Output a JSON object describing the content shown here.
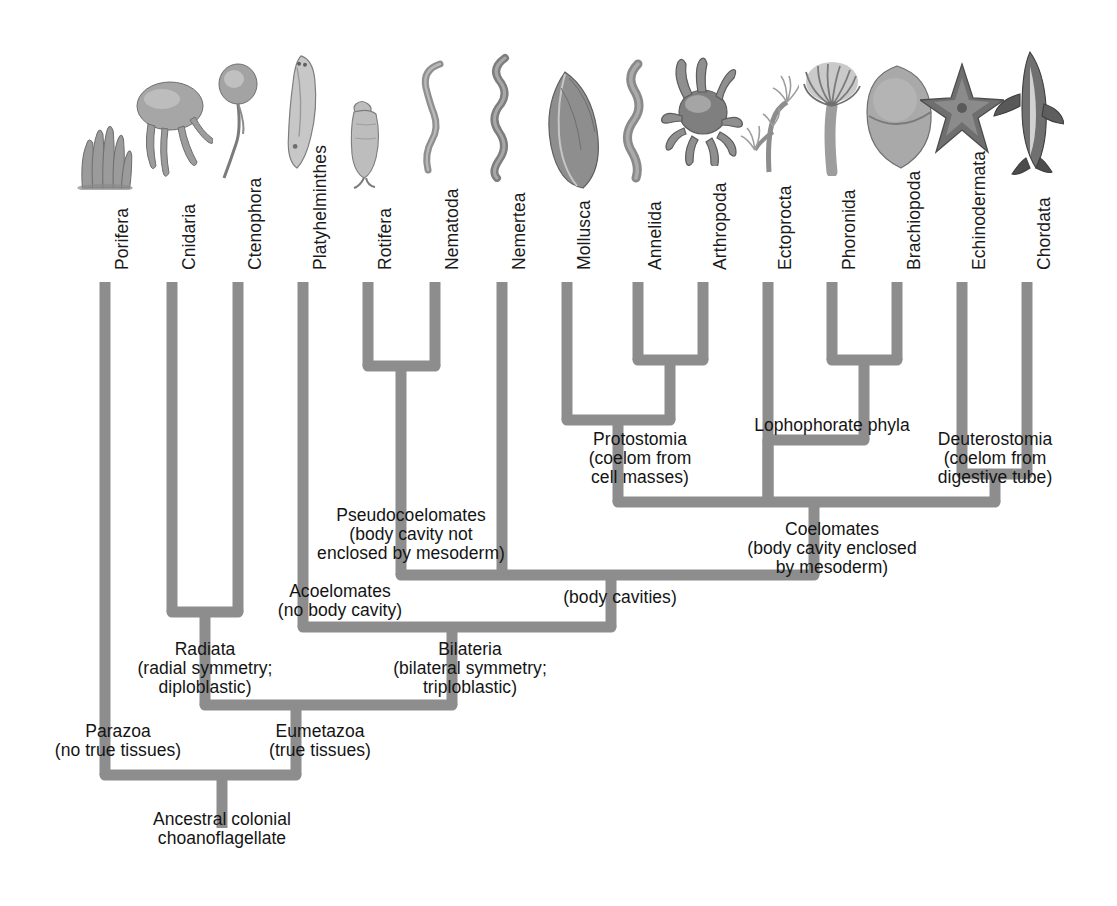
{
  "figure": {
    "type": "cladogram",
    "branch_color": "#8d8d8d",
    "background_color": "#ffffff",
    "text_color": "#141414"
  },
  "taxa": [
    {
      "name": "Porifera",
      "x": 105,
      "organism": "sponge-illustration",
      "organism_w": 62,
      "organism_h": 72,
      "organism_y": 118
    },
    {
      "name": "Cnidaria",
      "x": 172,
      "organism": "jellyfish-illustration",
      "organism_w": 82,
      "organism_h": 110,
      "organism_y": 72
    },
    {
      "name": "Ctenophora",
      "x": 238,
      "organism": "comb-jelly-illustration",
      "organism_w": 52,
      "organism_h": 120,
      "organism_y": 62
    },
    {
      "name": "Platyhelminthes",
      "x": 303,
      "organism": "flatworm-illustration",
      "organism_w": 50,
      "organism_h": 120,
      "organism_y": 52
    },
    {
      "name": "Rotifera",
      "x": 368,
      "organism": "rotifer-illustration",
      "organism_w": 40,
      "organism_h": 92,
      "organism_y": 98
    },
    {
      "name": "Nematoda",
      "x": 435,
      "organism": "roundworm-illustration",
      "organism_w": 52,
      "organism_h": 122,
      "organism_y": 58
    },
    {
      "name": "Nemertea",
      "x": 502,
      "organism": "ribbon-worm-illustration",
      "organism_w": 46,
      "organism_h": 130,
      "organism_y": 52
    },
    {
      "name": "Mollusca",
      "x": 567,
      "organism": "mussel-illustration",
      "organism_w": 72,
      "organism_h": 122,
      "organism_y": 68
    },
    {
      "name": "Annelida",
      "x": 638,
      "organism": "earthworm-illustration",
      "organism_w": 46,
      "organism_h": 126,
      "organism_y": 58
    },
    {
      "name": "Arthropoda",
      "x": 703,
      "organism": "crab-illustration",
      "organism_w": 86,
      "organism_h": 112,
      "organism_y": 54
    },
    {
      "name": "Ectoprocta",
      "x": 768,
      "organism": "bryozoan-illustration",
      "organism_w": 62,
      "organism_h": 118,
      "organism_y": 60
    },
    {
      "name": "Phoronida",
      "x": 832,
      "organism": "phoronid-illustration",
      "organism_w": 62,
      "organism_h": 124,
      "organism_y": 52
    },
    {
      "name": "Brachiopoda",
      "x": 897,
      "organism": "lampshell-illustration",
      "organism_w": 76,
      "organism_h": 112,
      "organism_y": 60
    },
    {
      "name": "Echinodermata",
      "x": 962,
      "organism": "sea-star-illustration",
      "organism_w": 84,
      "organism_h": 96,
      "organism_y": 60
    },
    {
      "name": "Chordata",
      "x": 1027,
      "organism": "shark-illustration",
      "organism_w": 74,
      "organism_h": 128,
      "organism_y": 48
    }
  ],
  "tip_label_baseline_y": 270,
  "branch_top_y": 282,
  "node_labels": [
    {
      "id": "pseudocoelomates",
      "align": "center",
      "x": 411,
      "y": 506,
      "lines": [
        "Pseudocoelomates",
        "(body cavity not",
        "enclosed by mesoderm)"
      ]
    },
    {
      "id": "acoelomates",
      "align": "center",
      "x": 340,
      "y": 582,
      "lines": [
        "Acoelomates",
        "(no body cavity)"
      ]
    },
    {
      "id": "protostomia",
      "align": "center",
      "x": 640,
      "y": 430,
      "lines": [
        "Protostomia",
        "(coelom from",
        "cell masses)"
      ]
    },
    {
      "id": "lophophorate-phyla",
      "align": "center",
      "x": 832,
      "y": 416,
      "lines": [
        "Lophophorate phyla"
      ]
    },
    {
      "id": "deuterostomia",
      "align": "center",
      "x": 995,
      "y": 430,
      "lines": [
        "Deuterostomia",
        "(coelom from",
        "digestive tube)"
      ]
    },
    {
      "id": "coelomates",
      "align": "center",
      "x": 832,
      "y": 520,
      "lines": [
        "Coelomates",
        "(body cavity enclosed",
        "by mesoderm)"
      ]
    },
    {
      "id": "body-cavities",
      "align": "center",
      "x": 620,
      "y": 588,
      "lines": [
        "(body cavities)"
      ]
    },
    {
      "id": "radiata",
      "align": "center",
      "x": 205,
      "y": 640,
      "lines": [
        "Radiata",
        "(radial symmetry;",
        "diploblastic)"
      ]
    },
    {
      "id": "bilateria",
      "align": "center",
      "x": 470,
      "y": 640,
      "lines": [
        "Bilateria",
        "(bilateral symmetry;",
        "triploblastic)"
      ]
    },
    {
      "id": "parazoa",
      "align": "center",
      "x": 118,
      "y": 722,
      "lines": [
        "Parazoa",
        "(no true tissues)"
      ]
    },
    {
      "id": "eumetazoa",
      "align": "center",
      "x": 320,
      "y": 722,
      "lines": [
        "Eumetazoa",
        "(true tissues)"
      ]
    },
    {
      "id": "ancestral-root",
      "align": "center",
      "x": 222,
      "y": 810,
      "lines": [
        "Ancestral colonial",
        "choanoflagellate"
      ]
    }
  ],
  "chart_data": {
    "type": "tree",
    "root": "Ancestral colonial choanoflagellate",
    "tips": [
      "Porifera",
      "Cnidaria",
      "Ctenophora",
      "Platyhelminthes",
      "Rotifera",
      "Nematoda",
      "Nemertea",
      "Mollusca",
      "Annelida",
      "Arthropoda",
      "Ectoprocta",
      "Phoronida",
      "Brachiopoda",
      "Echinodermata",
      "Chordata"
    ],
    "clades": [
      {
        "name": "Parazoa",
        "note": "no true tissues",
        "members": [
          "Porifera"
        ]
      },
      {
        "name": "Eumetazoa",
        "note": "true tissues",
        "members": [
          "Cnidaria",
          "Ctenophora",
          "Platyhelminthes",
          "Rotifera",
          "Nematoda",
          "Nemertea",
          "Mollusca",
          "Annelida",
          "Arthropoda",
          "Ectoprocta",
          "Phoronida",
          "Brachiopoda",
          "Echinodermata",
          "Chordata"
        ]
      },
      {
        "name": "Radiata",
        "note": "radial symmetry; diploblastic",
        "members": [
          "Cnidaria",
          "Ctenophora"
        ]
      },
      {
        "name": "Bilateria",
        "note": "bilateral symmetry; triploblastic",
        "members": [
          "Platyhelminthes",
          "Rotifera",
          "Nematoda",
          "Nemertea",
          "Mollusca",
          "Annelida",
          "Arthropoda",
          "Ectoprocta",
          "Phoronida",
          "Brachiopoda",
          "Echinodermata",
          "Chordata"
        ]
      },
      {
        "name": "Acoelomates",
        "note": "no body cavity",
        "members": [
          "Platyhelminthes"
        ]
      },
      {
        "name": "(body cavities)",
        "note": "",
        "members": [
          "Rotifera",
          "Nematoda",
          "Nemertea",
          "Mollusca",
          "Annelida",
          "Arthropoda",
          "Ectoprocta",
          "Phoronida",
          "Brachiopoda",
          "Echinodermata",
          "Chordata"
        ]
      },
      {
        "name": "Pseudocoelomates",
        "note": "body cavity not enclosed by mesoderm",
        "members": [
          "Rotifera",
          "Nematoda"
        ]
      },
      {
        "name": "Coelomates",
        "note": "body cavity enclosed by mesoderm",
        "members": [
          "Nemertea",
          "Mollusca",
          "Annelida",
          "Arthropoda",
          "Ectoprocta",
          "Phoronida",
          "Brachiopoda",
          "Echinodermata",
          "Chordata"
        ]
      },
      {
        "name": "Protostomia",
        "note": "coelom from cell masses",
        "members": [
          "Mollusca",
          "Annelida",
          "Arthropoda"
        ]
      },
      {
        "name": "Lophophorate phyla",
        "note": "",
        "members": [
          "Ectoprocta",
          "Phoronida",
          "Brachiopoda"
        ]
      },
      {
        "name": "Deuterostomia",
        "note": "coelom from digestive tube",
        "members": [
          "Echinodermata",
          "Chordata"
        ]
      }
    ]
  },
  "geometry": {
    "stroke_width": 11,
    "nodes": {
      "rotifera_nematoda": {
        "y": 366
      },
      "annelida_arthropoda": {
        "y": 360
      },
      "phoronida_brachiopoda": {
        "y": 360
      },
      "echinodermata_chordata": {
        "y": 474
      },
      "protostomia": {
        "y": 420,
        "x": 596
      },
      "lophophorate": {
        "y": 416,
        "x": 864
      },
      "pseudocoelomates": {
        "y": 400,
        "x": 401
      },
      "coelomates": {
        "y": 502,
        "x": 814
      },
      "protostome_coelomate_bar_y": 502,
      "body_cavities": {
        "y": 575,
        "x": 611
      },
      "bilateria": {
        "y": 627,
        "x": 452
      },
      "eumetazoa": {
        "y": 705,
        "x": 296
      },
      "radiata": {
        "y": 612
      },
      "root": {
        "y": 775,
        "x": 222
      }
    }
  }
}
